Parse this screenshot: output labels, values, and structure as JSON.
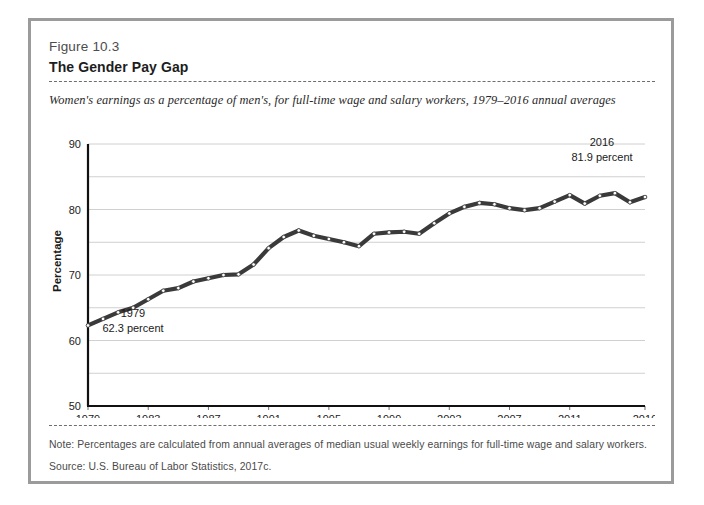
{
  "figure": {
    "label": "Figure 10.3",
    "title": "The Gender Pay Gap",
    "subtitle": "Women's earnings as a percentage of men's, for full-time wage and salary workers, 1979–2016 annual averages",
    "note": "Note: Percentages are calculated from annual averages of median usual weekly earnings for full-time wage and salary workers.",
    "source": "Source: U.S. Bureau of Labor Statistics, 2017c."
  },
  "colors": {
    "frame": "#9b9b9b",
    "line": "#3a3a3a",
    "grid": "#d0d0d0",
    "axis": "#111111",
    "text": "#1d1d1d"
  },
  "annotations": {
    "start": {
      "year": "1979",
      "value": "62.3 percent"
    },
    "end": {
      "year": "2016",
      "value": "81.9 percent"
    }
  },
  "chart_data": {
    "type": "line",
    "title": "The Gender Pay Gap",
    "subtitle": "Women's earnings as a percentage of men's, for full-time wage and salary workers, 1979–2016 annual averages",
    "xlabel": "",
    "ylabel": "Percentage",
    "ylim": [
      50,
      90
    ],
    "yticks": [
      50,
      60,
      70,
      80,
      90
    ],
    "ytick_labels": [
      "50",
      "60",
      "70",
      "80",
      "90"
    ],
    "minor_gridlines": true,
    "minor_grid_step": 5,
    "grid": true,
    "legend": "none",
    "xlim": [
      1979,
      2016
    ],
    "xticks": [
      1979,
      1983,
      1987,
      1991,
      1995,
      1999,
      2003,
      2007,
      2011,
      2016
    ],
    "xtick_labels": [
      "1979",
      "1983",
      "1987",
      "1991",
      "1995",
      "1999",
      "2003",
      "2007",
      "2011",
      "2016"
    ],
    "markers": "small-open-circles",
    "series": [
      {
        "name": "Women's earnings as a percentage of men's",
        "x": [
          1979,
          1980,
          1981,
          1982,
          1983,
          1984,
          1985,
          1986,
          1987,
          1988,
          1989,
          1990,
          1991,
          1992,
          1993,
          1994,
          1995,
          1996,
          1997,
          1998,
          1999,
          2000,
          2001,
          2002,
          2003,
          2004,
          2005,
          2006,
          2007,
          2008,
          2009,
          2010,
          2011,
          2012,
          2013,
          2014,
          2015,
          2016
        ],
        "values": [
          62.3,
          63.3,
          64.3,
          65.0,
          66.3,
          67.6,
          68.0,
          69.0,
          69.5,
          70.0,
          70.1,
          71.6,
          74.1,
          75.8,
          76.8,
          76.0,
          75.5,
          75.0,
          74.4,
          76.3,
          76.5,
          76.6,
          76.3,
          77.9,
          79.4,
          80.4,
          81.0,
          80.8,
          80.2,
          79.9,
          80.2,
          81.2,
          82.2,
          80.9,
          82.1,
          82.5,
          81.1,
          81.9
        ]
      }
    ]
  }
}
